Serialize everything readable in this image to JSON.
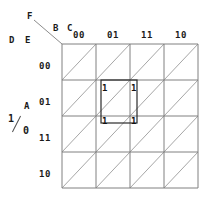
{
  "diagram": {
    "type": "karnaugh-map",
    "title_vars": {
      "f": "F",
      "b": "B",
      "c": "C",
      "d": "D",
      "e": "E",
      "a": "A",
      "a_numerator": "1",
      "a_denominator": "0"
    },
    "column_header_vars": "B C",
    "row_header_vars": "D E",
    "column_headers": [
      "00",
      "01",
      "11",
      "10"
    ],
    "row_headers": [
      "00",
      "01",
      "11",
      "10"
    ],
    "grid": {
      "rows": 4,
      "cols": 4,
      "cell_split": "diagonal"
    },
    "marked_cells": [
      {
        "label": "1",
        "row": "01",
        "col": "01",
        "half": "upper"
      },
      {
        "label": "1",
        "row": "01",
        "col": "11",
        "half": "upper"
      },
      {
        "label": "1",
        "row": "11",
        "col": "01",
        "half": "upper"
      },
      {
        "label": "1",
        "row": "11",
        "col": "11",
        "half": "upper"
      }
    ],
    "group_box": {
      "present": true,
      "spans_rows": [
        "01",
        "11"
      ],
      "spans_cols": [
        "01",
        "11"
      ]
    },
    "colors": {
      "grid_line": "#808080",
      "diagonal_line": "#a6a6a6",
      "group_box": "#2b2b2b",
      "text": "#1a1a1a",
      "background": "#ffffff"
    }
  }
}
